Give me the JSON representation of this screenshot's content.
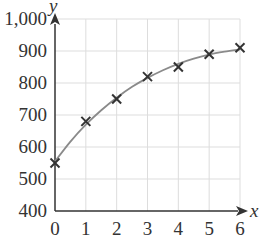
{
  "chart_data": {
    "type": "scatter",
    "title": "",
    "xlabel": "x",
    "ylabel": "y",
    "xlim": [
      0,
      6
    ],
    "ylim": [
      400,
      1000
    ],
    "grid": true,
    "legend": null,
    "x_ticks": [
      "0",
      "1",
      "2",
      "3",
      "4",
      "5",
      "6"
    ],
    "y_ticks": [
      "400",
      "500",
      "600",
      "700",
      "800",
      "900",
      "1,000"
    ],
    "series": [
      {
        "name": "data points",
        "marker": "x",
        "x": [
          0,
          1,
          2,
          3,
          4,
          5,
          6
        ],
        "values": [
          550,
          680,
          750,
          820,
          850,
          890,
          910
        ]
      },
      {
        "name": "fitted curve",
        "marker": "none",
        "style": "line",
        "x": [
          0,
          0.5,
          1,
          1.5,
          2,
          2.5,
          3,
          3.5,
          4,
          4.5,
          5,
          5.5,
          6
        ],
        "values": [
          555,
          617,
          670,
          715,
          754,
          788,
          816,
          840,
          860,
          876,
          889,
          898,
          905
        ]
      }
    ]
  },
  "colors": {
    "axis": "#333333",
    "grid": "#dddddd",
    "curve": "#8a8a8a",
    "marker": "#333333"
  }
}
